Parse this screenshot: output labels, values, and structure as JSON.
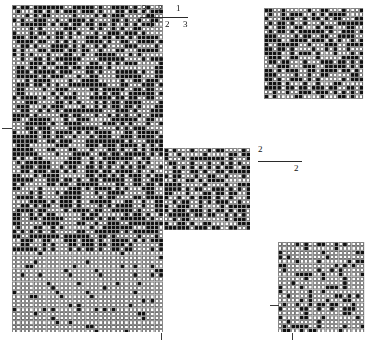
{
  "figure": {
    "background_color": "#ffffff",
    "cell_dark_color": "#111111",
    "cell_light_color": "#ffffff",
    "cell_border_color": "#8a8a8a",
    "width": 370,
    "height": 340
  },
  "blocks": [
    {
      "id": "main-grid",
      "name": "main-pattern-grid",
      "x": 12,
      "y": 5,
      "width": 151,
      "height": 327,
      "cell_size": 4.32,
      "cols": 35,
      "rows": 76,
      "pattern": "diagonal-dense-top-sparse-bottom",
      "seed": 1971,
      "density_top": 0.52,
      "density_bottom": 0.05,
      "transition_row": 57,
      "diagonal_strength": 0.55
    },
    {
      "id": "top-right-grid",
      "name": "top-right-pattern-grid",
      "x": 264,
      "y": 8,
      "width": 101,
      "height": 92,
      "cell_size": 4.32,
      "cols": 23,
      "rows": 21,
      "pattern": "dense-blocky",
      "seed": 2207,
      "density_top": 0.5,
      "density_bottom": 0.5,
      "transition_row": 21,
      "diagonal_strength": 0.15
    },
    {
      "id": "middle-grid",
      "name": "middle-pattern-grid",
      "x": 164,
      "y": 148,
      "width": 86,
      "height": 84,
      "cell_size": 4.32,
      "cols": 20,
      "rows": 19,
      "pattern": "dense-checker",
      "seed": 3319,
      "density_top": 0.47,
      "density_bottom": 0.47,
      "transition_row": 19,
      "diagonal_strength": 0.1
    },
    {
      "id": "bottom-right-grid",
      "name": "bottom-right-pattern-grid",
      "x": 278,
      "y": 242,
      "width": 87,
      "height": 90,
      "cell_size": 4.32,
      "cols": 20,
      "rows": 21,
      "pattern": "sparse-checker",
      "seed": 4441,
      "density_top": 0.26,
      "density_bottom": 0.26,
      "transition_row": 21,
      "diagonal_strength": 0.05
    }
  ],
  "axis_scales": [
    {
      "id": "top-scale",
      "name": "top-axis-scale",
      "x": 140,
      "y": 4,
      "width": 48,
      "rule_y": 13,
      "labels_above": [
        "3",
        "2",
        "1"
      ],
      "labels_below": [
        "1",
        "2",
        "3"
      ],
      "above_x": [
        2,
        18,
        36
      ],
      "below_x": [
        9,
        25,
        43
      ]
    },
    {
      "id": "middle-scale",
      "name": "middle-axis-scale",
      "x": 258,
      "y": 145,
      "width": 44,
      "rule_y": 16,
      "labels_above": [
        "2"
      ],
      "labels_below": [
        "2"
      ],
      "above_x": [
        0
      ],
      "below_x": [
        36
      ]
    }
  ],
  "ticks": [
    {
      "id": "t1",
      "name": "main-grid-left-tick",
      "orientation": "horizontal",
      "x": 2,
      "y": 128,
      "length": 10
    },
    {
      "id": "t2",
      "name": "main-grid-bottom-tick",
      "orientation": "vertical",
      "x": 161,
      "y": 333,
      "length": 7
    },
    {
      "id": "t3",
      "name": "bottom-right-left-tick",
      "orientation": "horizontal",
      "x": 270,
      "y": 305,
      "length": 9
    },
    {
      "id": "t4",
      "name": "bottom-right-bottom-tick",
      "orientation": "vertical",
      "x": 292,
      "y": 333,
      "length": 7
    }
  ]
}
